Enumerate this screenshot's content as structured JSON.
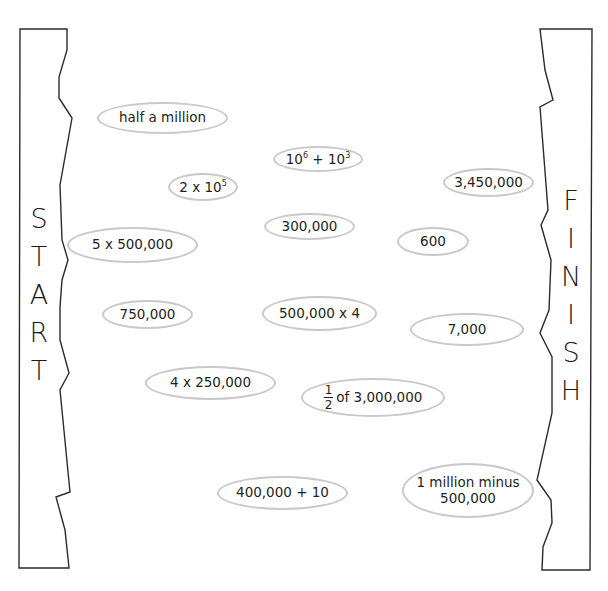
{
  "start_panel": {
    "label": "START",
    "letters": [
      "S",
      "T",
      "A",
      "R",
      "T"
    ]
  },
  "finish_panel": {
    "label": "FINISH",
    "letters": [
      "F",
      "I",
      "N",
      "I",
      "S",
      "H"
    ]
  },
  "ovals": [
    {
      "id": "half-a-million",
      "text": "half a million"
    },
    {
      "id": "ten6-plus-ten3",
      "base1": "10",
      "exp1": "6",
      "op": " + ",
      "base2": "10",
      "exp2": "3"
    },
    {
      "id": "two-times-ten5",
      "base": "2 x 10",
      "exp": "5"
    },
    {
      "id": "3450000",
      "text": "3,450,000"
    },
    {
      "id": "300000",
      "text": "300,000"
    },
    {
      "id": "600",
      "text": "600"
    },
    {
      "id": "5x500000",
      "text": "5 x 500,000"
    },
    {
      "id": "750000",
      "text": "750,000"
    },
    {
      "id": "500000x4",
      "text": "500,000 x 4"
    },
    {
      "id": "7000",
      "text": "7,000"
    },
    {
      "id": "4x250000",
      "text": "4 x 250,000"
    },
    {
      "id": "half-of-3000000",
      "numerator": "1",
      "denominator": "2",
      "text": "of 3,000,000"
    },
    {
      "id": "400000plus10",
      "text": "400,000 + 10"
    },
    {
      "id": "1million-minus-500000",
      "line1": "1 million minus",
      "line2": "500,000"
    }
  ],
  "colors": {
    "oval_border": "#c9c9c9",
    "panel_stroke": "#2b2b2b",
    "text": "#231f20"
  }
}
